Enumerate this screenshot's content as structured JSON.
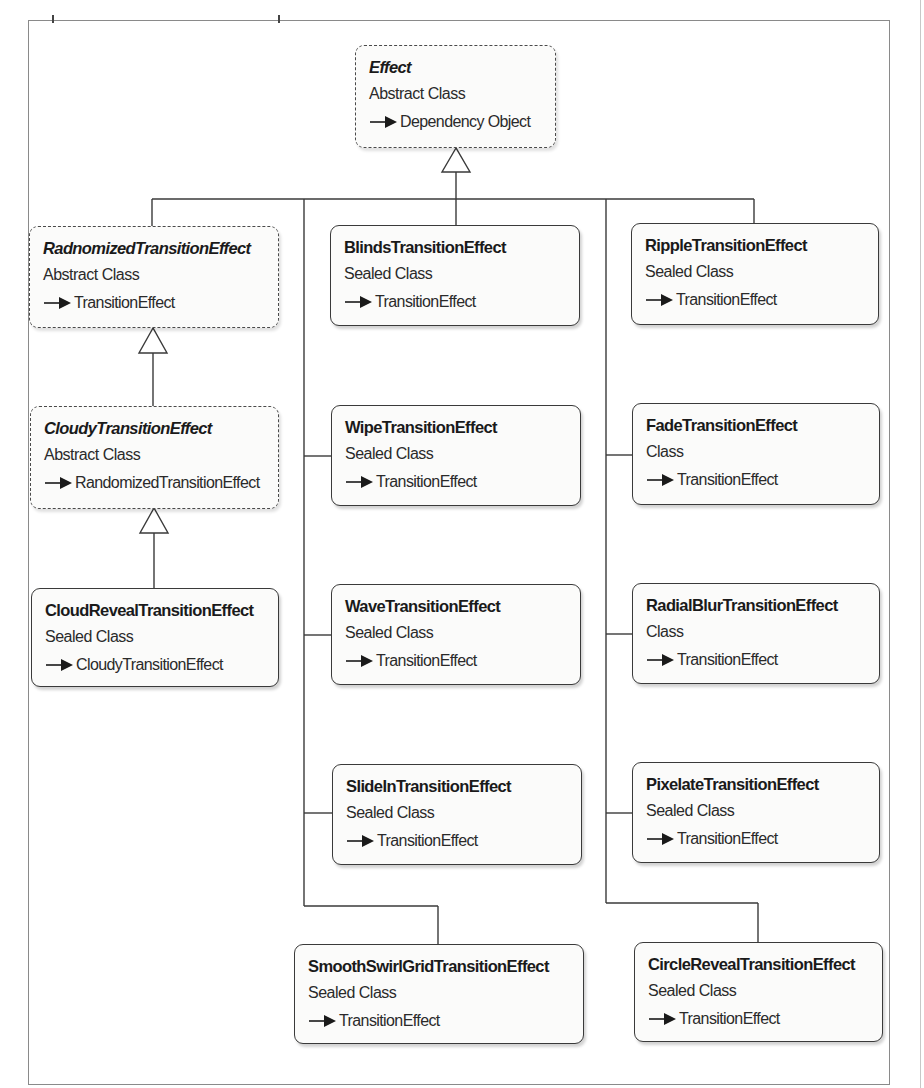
{
  "diagram": {
    "type": "class-hierarchy",
    "colors": {
      "line": "#3a3a3a",
      "box_fill": "#fbfbfa",
      "text": "#1a1a1a",
      "frame": "#8a8a8a"
    },
    "root": {
      "name": "Effect",
      "kind": "Abstract Class",
      "base": "Dependency Object",
      "style": "dashed"
    },
    "left_column": [
      {
        "name": "RadnomizedTransitionEffect",
        "kind": "Abstract Class",
        "base": "TransitionEffect",
        "style": "dashed"
      },
      {
        "name": "CloudyTransitionEffect",
        "kind": "Abstract Class",
        "base": "RandomizedTransitionEffect",
        "style": "dashed"
      },
      {
        "name": "CloudRevealTransitionEffect",
        "kind": "Sealed Class",
        "base": "CloudyTransitionEffect",
        "style": "solid"
      }
    ],
    "middle_column": [
      {
        "name": "BlindsTransitionEffect",
        "kind": "Sealed Class",
        "base": "TransitionEffect",
        "style": "solid"
      },
      {
        "name": "WipeTransitionEffect",
        "kind": "Sealed Class",
        "base": "TransitionEffect",
        "style": "solid"
      },
      {
        "name": "WaveTransitionEffect",
        "kind": "Sealed Class",
        "base": "TransitionEffect",
        "style": "solid"
      },
      {
        "name": "SlideInTransitionEffect",
        "kind": "Sealed Class",
        "base": "TransitionEffect",
        "style": "solid"
      },
      {
        "name": "SmoothSwirlGridTransitionEffect",
        "kind": "Sealed Class",
        "base": "TransitionEffect",
        "style": "solid"
      }
    ],
    "right_column": [
      {
        "name": "RippleTransitionEffect",
        "kind": "Sealed Class",
        "base": "TransitionEffect",
        "style": "solid"
      },
      {
        "name": "FadeTransitionEffect",
        "kind": "Class",
        "base": "TransitionEffect",
        "style": "solid"
      },
      {
        "name": "RadialBlurTransitionEffect",
        "kind": "Class",
        "base": "TransitionEffect",
        "style": "solid"
      },
      {
        "name": "PixelateTransitionEffect",
        "kind": "Sealed Class",
        "base": "TransitionEffect",
        "style": "solid"
      },
      {
        "name": "CircleRevealTransitionEffect",
        "kind": "Sealed Class",
        "base": "TransitionEffect",
        "style": "solid"
      }
    ],
    "legend": {
      "dashed_border": "abstract class",
      "solid_border": "concrete class",
      "hollow_triangle": "inheritance",
      "arrow_prefix": "derives from"
    }
  }
}
